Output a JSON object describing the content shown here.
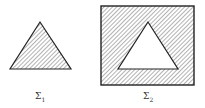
{
  "figures": [
    {
      "name": "sigma-1",
      "label": "Σ",
      "subscript": "1",
      "description": "hatched triangle"
    },
    {
      "name": "sigma-2",
      "label": "Σ",
      "subscript": "2",
      "description": "hatched square with triangular hole"
    }
  ],
  "colors": {
    "stroke": "#222222",
    "hatch": "#555555",
    "background": "#ffffff"
  }
}
